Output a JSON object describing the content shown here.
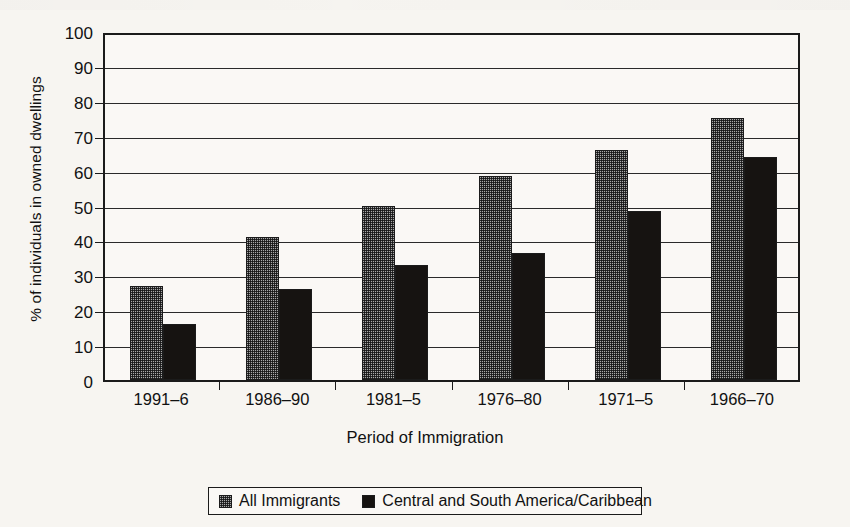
{
  "chart_data": {
    "type": "bar",
    "title": "",
    "xlabel": "Period of Immigration",
    "ylabel": "% of individuals in owned dwellings",
    "categories": [
      "1991–6",
      "1986–90",
      "1981–5",
      "1976–80",
      "1971–5",
      "1966–70"
    ],
    "series": [
      {
        "name": "All Immigrants",
        "values": [
          27,
          41,
          50,
          58.5,
          66,
          75
        ],
        "color": "#a9a9a9",
        "pattern": "checkered"
      },
      {
        "name": "Central and South America/Caribbean",
        "values": [
          16,
          26,
          33,
          36.5,
          48.5,
          64
        ],
        "color": "#161311",
        "pattern": "solid"
      }
    ],
    "ylim": [
      0,
      100
    ],
    "ytick_values": [
      0,
      10,
      20,
      30,
      40,
      50,
      60,
      70,
      80,
      90,
      100
    ],
    "ytick_labels": [
      "0",
      "10",
      "20",
      "30",
      "40",
      "50",
      "60",
      "70",
      "80",
      "90",
      "100"
    ],
    "grid": true,
    "grid_axis": "y",
    "legend_position": "bottom-center",
    "bar_group_count": 6,
    "bars_per_group": 2
  },
  "axes": {
    "y_title": "% of individuals in owned dwellings",
    "x_title": "Period of Immigration"
  },
  "legend": {
    "entries": [
      {
        "label": "All Immigrants",
        "swatch": "gray-checkered-swatch"
      },
      {
        "label": "Central and South America/Caribbean",
        "swatch": "black-solid-swatch"
      }
    ]
  },
  "colors": {
    "background": "#f7f5f1",
    "plot_background": "#faf8f5",
    "ink": "#1b1b1b",
    "series_all_immigrants": "#a9a9a9",
    "series_central_south_america": "#161311"
  }
}
